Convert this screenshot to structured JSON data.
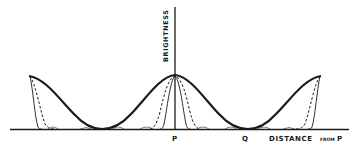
{
  "diagram": {
    "y_axis_label": "BRIGHTNESS",
    "x_axis_label_main": "DISTANCE",
    "x_axis_label_small": "FROM",
    "x_axis_label_end": "P",
    "point_p": "P",
    "point_q": "Q",
    "curves": [
      {
        "name": "broad",
        "style": "thick-solid",
        "description": "two-slit broad cos² fringes"
      },
      {
        "name": "medium",
        "style": "dashed",
        "description": "narrower principal maxima"
      },
      {
        "name": "narrow",
        "style": "thin-solid",
        "description": "sharpest principal maxima with small secondary maxima"
      }
    ],
    "peaks_x": [
      29,
      175,
      321
    ],
    "colors": {
      "ink": "#1a1a1a",
      "background": "#ffffff"
    }
  }
}
